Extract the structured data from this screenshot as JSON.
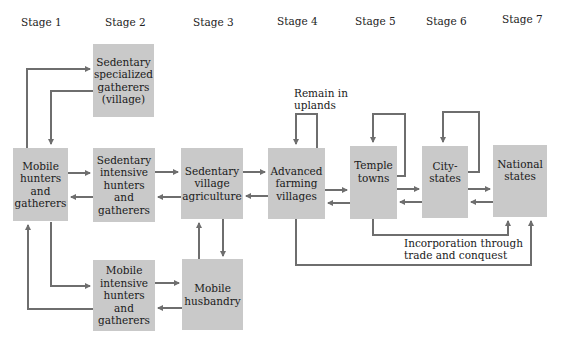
{
  "stages": [
    "Stage 1",
    "Stage 2",
    "Stage 3",
    "Stage 4",
    "Stage 5",
    "Stage 6",
    "Stage 7"
  ],
  "nodes": {
    "sedentary_specialized": "Sedentary\nspecialized\ngatherers\n(village)",
    "mobile_hunters": "Mobile\nhunters\nand\ngatherers",
    "sedentary_intensive": "Sedentary\nintensive\nhunters\nand\ngatherers",
    "sedentary_village_agriculture": "Sedentary\nvillage\nagriculture",
    "advanced_farming": "Advanced\nfarming\nvillages",
    "temple_towns": "Temple\ntowns",
    "city_states": "City-\nstates",
    "national_states": "National\nstates",
    "mobile_intensive": "Mobile\nintensive\nhunters\nand\ngatherers",
    "mobile_husbandry": "Mobile\nhusbandry"
  },
  "labels": {
    "remain_uplands": "Remain in\nuplands",
    "incorporation": "Incorporation through\ntrade and conquest"
  },
  "colors": {
    "box_fill": "#c9c9c9",
    "arrow": "#6e6e6e"
  }
}
